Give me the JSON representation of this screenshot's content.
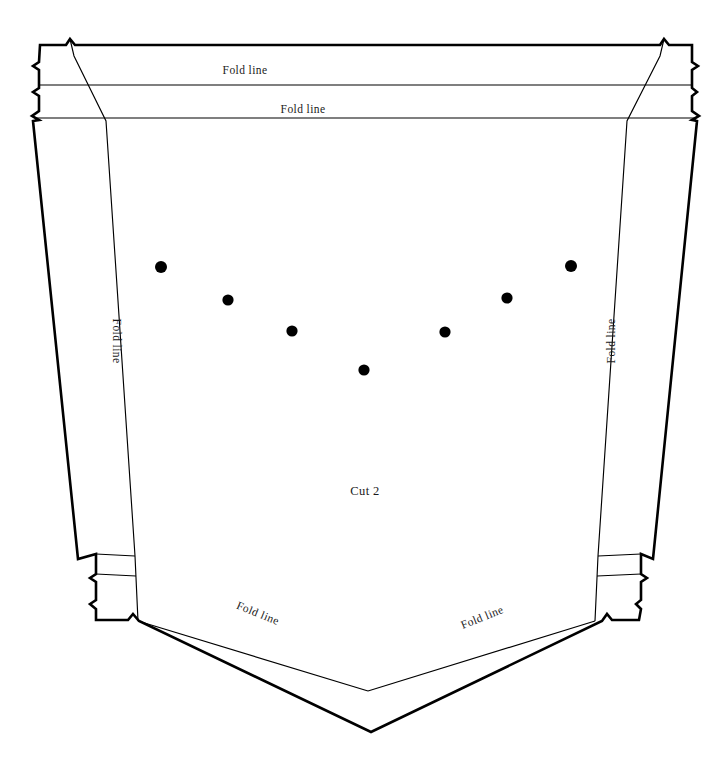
{
  "document": {
    "type": "sewing-pattern-template",
    "title": "Pattern piece template",
    "background_color": "#ffffff",
    "line_color": "#000000",
    "text_color": "#1a1a1a"
  },
  "piece": {
    "name_label": "Cut 2",
    "name_position": {
      "x": 365,
      "y": 491
    }
  },
  "labels": {
    "fold_line": "Fold line"
  },
  "fold_labels": [
    {
      "id": "top-outer",
      "text": "Fold line",
      "x": 245,
      "y": 70,
      "rotation": 0
    },
    {
      "id": "top-inner",
      "text": "Fold line",
      "x": 303,
      "y": 109,
      "rotation": 0
    },
    {
      "id": "left-side",
      "text": "Fold line",
      "x": 117,
      "y": 341,
      "rotation": 90
    },
    {
      "id": "right-side",
      "text": "Fold line",
      "x": 611,
      "y": 341,
      "rotation": -90
    },
    {
      "id": "bottom-left",
      "text": "Fold line",
      "x": 258,
      "y": 613,
      "rotation": 22
    },
    {
      "id": "bottom-right",
      "text": "Fold line",
      "x": 482,
      "y": 617,
      "rotation": -22
    }
  ],
  "marking_dots": [
    {
      "id": "dot-1",
      "x": 161,
      "y": 267,
      "r": 6.0
    },
    {
      "id": "dot-2",
      "x": 228,
      "y": 300,
      "r": 5.6
    },
    {
      "id": "dot-3",
      "x": 292,
      "y": 331,
      "r": 5.6
    },
    {
      "id": "dot-4",
      "x": 364,
      "y": 370,
      "r": 5.6
    },
    {
      "id": "dot-5",
      "x": 445,
      "y": 332,
      "r": 5.6
    },
    {
      "id": "dot-6",
      "x": 507,
      "y": 298,
      "r": 5.6
    },
    {
      "id": "dot-7",
      "x": 571,
      "y": 266,
      "r": 6.0
    }
  ],
  "geometry": {
    "cut_outline": "M 40 45 L 67 45 L 70 40 L 74 45 L 661 45 L 665 40 L 668 45 L 690 45 L 690 63 L 695 66 L 690 70 L 690 89 L 694 92 L 690 96 L 690 112 L 696 116 L 690 120 L 697 122 L 652 560 L 642 555 L 640 575 L 645 578 L 640 582 L 640 600 L 636 604 L 640 608 L 638 620 L 612 620 L 608 615 L 604 621 L 372 732 L 136 621 L 131 615 L 127 620 L 95 620 L 95 604 L 90 600 L 95 596 L 95 578 L 90 575 L 95 571 L 95 557 L 78 562 L 33 122 L 38 120 L 32 116 L 38 112 L 38 96 L 33 92 L 38 89 L 38 70 L 33 66 L 38 63 Z",
    "fold_top_1": "M 40 85 L 690 85",
    "fold_top_2": "M 36 118 L 694 118",
    "fold_left": "M 70 40 L 72 50 L 105 120 L 134 556 L 136 621",
    "fold_right": "M 665 40 L 662 50 L 628 120 L 598 556 L 596 621",
    "fold_bottom_left": "M 136 621 L 368 691",
    "fold_bottom_right": "M 596 621 L 368 691",
    "side_tab_left_top": "M 95 557 L 134 556",
    "side_tab_right_top": "M 642 555 L 598 556",
    "bottom_edge_left": "M 95 571 L 134 571",
    "bottom_edge_right": "M 640 575 L 598 573"
  }
}
